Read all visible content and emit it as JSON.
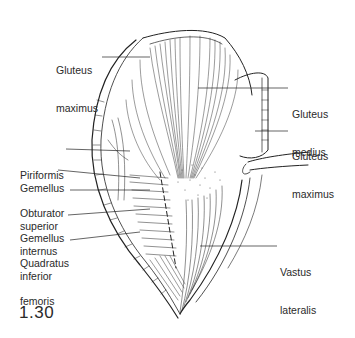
{
  "figure": {
    "number": "1.30",
    "labels": [
      {
        "id": "gluteus-maximus-left",
        "line1": "Gluteus",
        "line2": "maximus",
        "x": 56,
        "y": 39
      },
      {
        "id": "gluteus-medius",
        "line1": "Gluteus",
        "line2": "medius",
        "x": 292,
        "y": 83
      },
      {
        "id": "gluteus-maximus-right",
        "line1": "Gluteus",
        "line2": "maximus",
        "x": 292,
        "y": 120
      },
      {
        "id": "piriformis",
        "line1": "Piriformis",
        "line2": "",
        "x": 20,
        "y": 144
      },
      {
        "id": "gemellus-superior",
        "line1": "Gemellus",
        "line2": "superior",
        "x": 20,
        "y": 157
      },
      {
        "id": "obturator-internus",
        "line1": "Obturator",
        "line2": "internus",
        "x": 20,
        "y": 182
      },
      {
        "id": "gemellus-inferior",
        "line1": "Gemellus",
        "line2": "inferior",
        "x": 20,
        "y": 207
      },
      {
        "id": "quadratus-femoris",
        "line1": "Quadratus",
        "line2": "femoris",
        "x": 20,
        "y": 232
      },
      {
        "id": "vastus-lateralis",
        "line1": "Vastus",
        "line2": "lateralis",
        "x": 280,
        "y": 243
      }
    ]
  }
}
